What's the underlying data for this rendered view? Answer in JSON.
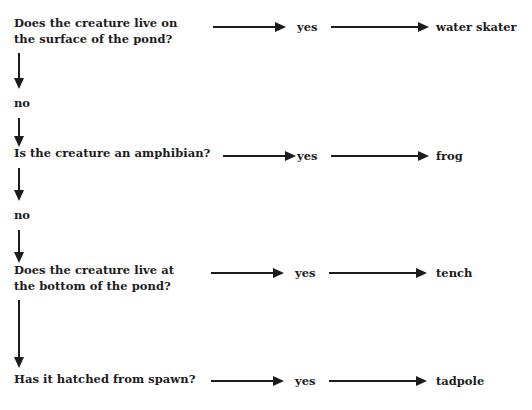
{
  "diagram": {
    "type": "decision-tree-flowchart",
    "text_color": "#1c1c1c",
    "background_color": "#ffffff",
    "yes_label": "yes",
    "no_label": "no",
    "rows": [
      {
        "id": "row-1",
        "question": "Does the creature live on\nthe surface of the pond?",
        "yes": "yes",
        "answer": "water skater",
        "no": "no"
      },
      {
        "id": "row-2",
        "question": "Is the creature an amphibian?",
        "yes": "yes",
        "answer": "frog",
        "no": "no"
      },
      {
        "id": "row-3",
        "question": "Does the creature live at\nthe bottom of the pond?",
        "yes": "yes",
        "answer": "tench",
        "no": ""
      },
      {
        "id": "row-4",
        "question": "Has it hatched from spawn?",
        "yes": "yes",
        "answer": "tadpole",
        "no": ""
      }
    ],
    "no_labels": [
      "no",
      "no"
    ]
  }
}
